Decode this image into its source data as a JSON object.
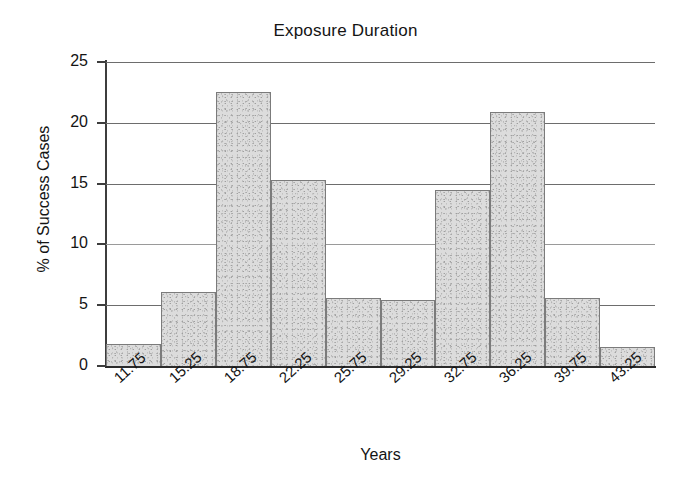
{
  "chart_data": {
    "type": "bar",
    "title": "Exposure Duration",
    "xlabel": "Years",
    "ylabel": "% of Success Cases",
    "categories": [
      "11.75",
      "15.25",
      "18.75",
      "22.25",
      "25.75",
      "29.25",
      "32.75",
      "36.25",
      "39.75",
      "43.25"
    ],
    "values": [
      1.8,
      6.1,
      22.5,
      15.3,
      5.6,
      5.4,
      14.5,
      20.9,
      5.6,
      1.6
    ],
    "ylim": [
      0,
      25
    ],
    "yticks": [
      0,
      5,
      10,
      15,
      20,
      25
    ],
    "ytick_labels": [
      "0",
      "5",
      "10",
      "15",
      "20",
      "25"
    ],
    "grid": true,
    "legend": "none",
    "bar_style": "contiguous-histogram",
    "colors": {
      "bar_fill": "#dcdcdc",
      "bar_border": "#7b7b7b",
      "axis": "#2b2b2b",
      "gridline": "#6d6d6d",
      "text": "#141414",
      "background": "#ffffff"
    }
  }
}
